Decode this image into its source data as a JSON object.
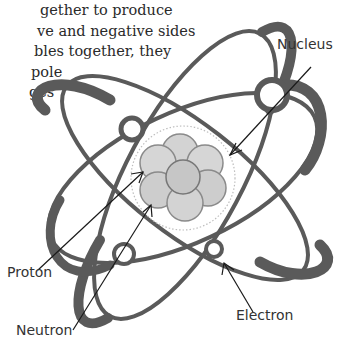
{
  "paragraph": {
    "lines": [
      "gether to produce",
      "ve and negative sides",
      "bles together, they",
      "pole",
      "ges"
    ]
  },
  "diagram": {
    "labels": {
      "nucleus": "Nucleus",
      "proton": "Proton",
      "neutron": "Neutron",
      "electron": "Electron"
    },
    "colors": {
      "orbit": "#5a5a5a",
      "particle": "#cfcfcf",
      "particle_stroke": "#8a8a8a",
      "leader_line": "#1a1a1a"
    }
  }
}
